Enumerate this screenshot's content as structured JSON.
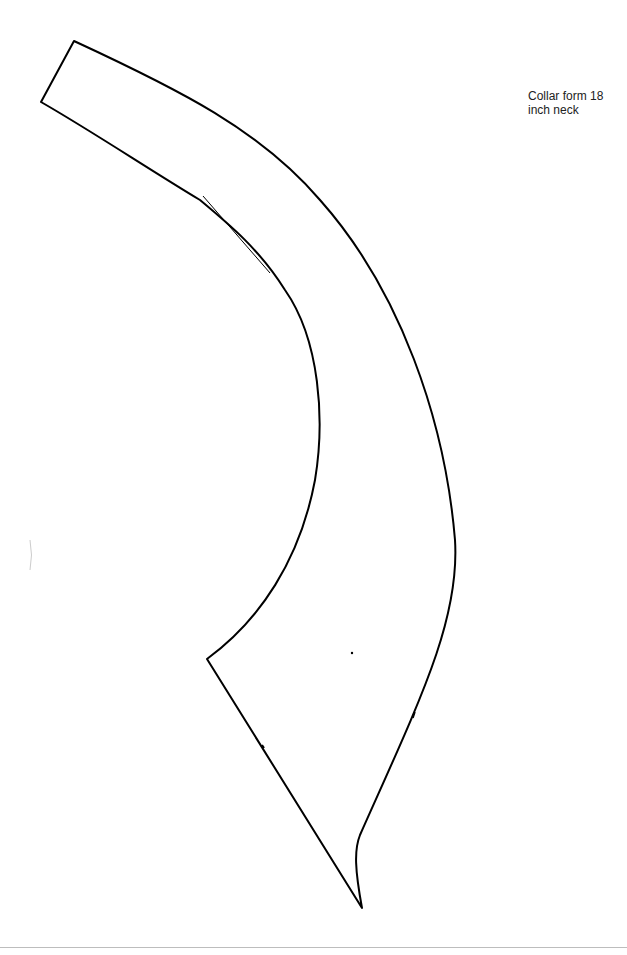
{
  "document": {
    "label": "Collar form 18\ninch neck",
    "stroke_color": "#000000",
    "background": "#ffffff"
  },
  "pattern": {
    "name": "collar-form",
    "neck_size": "18 inch"
  }
}
